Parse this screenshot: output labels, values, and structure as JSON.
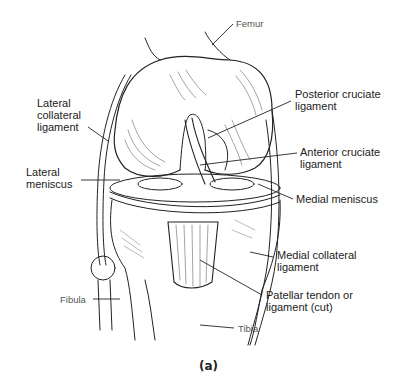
{
  "figure": {
    "caption": "(a)"
  },
  "labels": {
    "femur": "Femur",
    "lateral_collateral_ligament": "Lateral\ncollateral\nligament",
    "lateral_meniscus": "Lateral\nmeniscus",
    "fibula": "Fibula",
    "posterior_cruciate_ligament": "Posterior cruciate\nligament",
    "anterior_cruciate_ligament": "Anterior cruciate\nligament",
    "medial_meniscus": "Medial meniscus",
    "medial_collateral_ligament": "Medial collateral\nligament",
    "patellar_tendon": "Patellar tendon or\nligament (cut)",
    "tibia": "Tibia"
  },
  "colors": {
    "line": "#222222",
    "background": "#ffffff",
    "hatch": "#555555"
  }
}
